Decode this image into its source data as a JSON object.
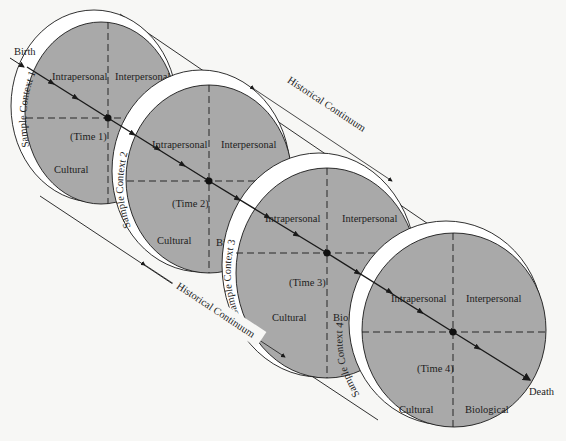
{
  "diagram": {
    "type": "life-span cylinder of sample contexts",
    "endpoints": {
      "start": "Birth",
      "end": "Death"
    },
    "historical_continuum": {
      "top": "Historical Continuum",
      "bottom": "Historical Continuum"
    },
    "colors": {
      "disc_fill": "#a9a9a9",
      "ring_fill": "#ffffff",
      "line": "#1a1a1a",
      "background": "#f7f7f5"
    },
    "contexts": [
      {
        "ring_label": "Sample Context 1",
        "time": "(Time 1)",
        "quadrants": {
          "tl": "Intrapersonal",
          "tr": "Interpersonal",
          "bl": "Cultural",
          "br": "B"
        }
      },
      {
        "ring_label": "Sample Context 2",
        "time": "(Time 2)",
        "quadrants": {
          "tl": "Intrapersonal",
          "tr": "Interpersonal",
          "bl": "Cultural",
          "br": "Bio"
        }
      },
      {
        "ring_label": "Sample Context 3",
        "time": "(Time 3)",
        "quadrants": {
          "tl": "Intrapersonal",
          "tr": "Interpersonal",
          "bl": "Cultural",
          "br": "Biol"
        }
      },
      {
        "ring_label": "Sample Context 4",
        "time": "(Time 4)",
        "quadrants": {
          "tl": "Intrapersonal",
          "tr": "Interpersonal",
          "bl": "Cultural",
          "br": "Biological"
        }
      }
    ]
  }
}
